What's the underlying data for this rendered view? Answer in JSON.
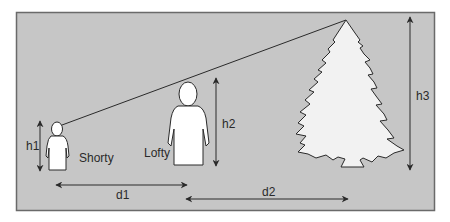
{
  "diagram": {
    "colors": {
      "page": "#ffffff",
      "panel": "#c6c6c6",
      "panel_border": "#6a6a6a",
      "figure_fill": "#ffffff",
      "tree_fill": "#f2f2f2",
      "stroke": "#2a2a2a"
    },
    "people": [
      {
        "name": "Shorty",
        "height_label": "h1"
      },
      {
        "name": "Lofty",
        "height_label": "h2"
      }
    ],
    "tree": {
      "height_label": "h3"
    },
    "distances": [
      {
        "label": "d1",
        "from": "Shorty",
        "to": "Lofty"
      },
      {
        "label": "d2",
        "from": "Lofty",
        "to": "tree"
      }
    ],
    "sight_line": {
      "from": "Shorty head",
      "to": "tree top"
    }
  }
}
